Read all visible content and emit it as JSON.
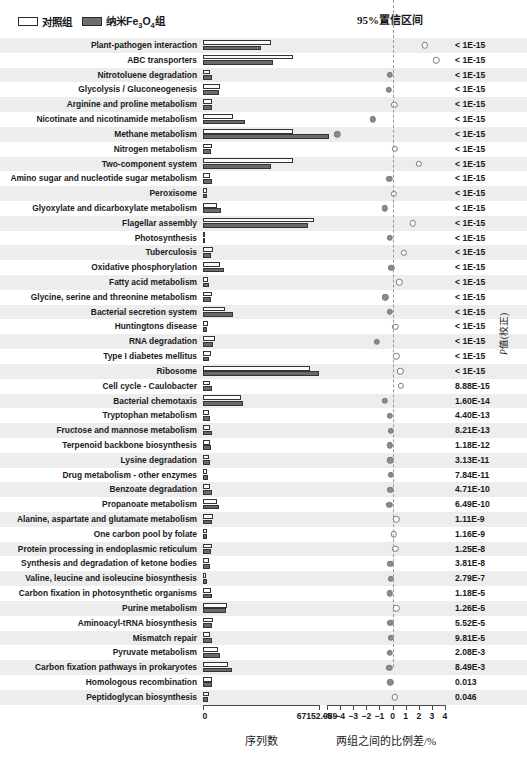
{
  "legend": {
    "control_label": "对照组",
    "treatment_label_pre": "纳米Fe",
    "treatment_label_sub": "3",
    "treatment_label_mid": "O",
    "treatment_label_sub2": "4",
    "treatment_label_post": "组",
    "treatment_label_full": "纳米Fe3O4组",
    "control_swatch_color": "#ffffff",
    "treatment_swatch_color": "#6e6e6e"
  },
  "header": {
    "ci_title": "95%置信区间"
  },
  "axes": {
    "left_title": "序列数",
    "right_title": "两组之间的比例差/%",
    "pvalue_title_prefix": "P",
    "pvalue_title_rest": "值(校正)",
    "left_ticks": [
      "0",
      "67152.089"
    ],
    "left_min": 0,
    "left_max": 67152.089,
    "right_ticks": [
      "-5",
      "-4",
      "-3",
      "-2",
      "-1",
      "0",
      "1",
      "2",
      "3",
      "4"
    ],
    "right_min": -5,
    "right_max": 4
  },
  "chart_data": {
    "type": "bar",
    "title": "",
    "subtitle": "",
    "xlabel": "序列数 / 两组之间的比例差/%",
    "ylabel": "KEGG pathway",
    "grid": false,
    "legend_position": "top-left",
    "columns": [
      "Pathway",
      "对照组 (sequence count)",
      "纳米Fe3O4组 (sequence count)",
      "Proportion difference (%)",
      "P值(校正)"
    ],
    "left_axis": {
      "label": "序列数",
      "range": [
        0,
        67152.089
      ],
      "ticks": [
        0,
        67152.089
      ]
    },
    "right_axis": {
      "label": "两组之间的比例差/%",
      "range": [
        -5,
        4
      ],
      "ticks": [
        -5,
        -4,
        -3,
        -2,
        -1,
        0,
        1,
        2,
        3,
        4
      ],
      "zero_reference_line": true
    },
    "series": [
      {
        "name": "对照组",
        "color": "#fafafa",
        "style": "open-bar"
      },
      {
        "name": "纳米Fe3O4组",
        "color": "#6a6a6a",
        "style": "filled-bar"
      }
    ],
    "rows": [
      {
        "label": "Plant-pathogen interaction",
        "control": 39300,
        "treatment": 33600,
        "diff": 2.45,
        "pvalue": "< 1E-15"
      },
      {
        "label": "ABC transporters",
        "control": 52000,
        "treatment": 40500,
        "diff": 3.35,
        "pvalue": "< 1E-15"
      },
      {
        "label": "Nitrotoluene degradation",
        "control": 4300,
        "treatment": 5300,
        "diff": -0.22,
        "pvalue": "< 1E-15"
      },
      {
        "label": "Glycolysis / Gluconeogenesis",
        "control": 10100,
        "treatment": 9300,
        "diff": -0.27,
        "pvalue": "< 1E-15"
      },
      {
        "label": "Arginine and proline metabolism",
        "control": 5100,
        "treatment": 5200,
        "diff": 0.12,
        "pvalue": "< 1E-15"
      },
      {
        "label": "Nicotinate and nicotinamide metabolism",
        "control": 17500,
        "treatment": 24300,
        "diff": -1.52,
        "pvalue": "< 1E-15"
      },
      {
        "label": "Methane metabolism",
        "control": 51900,
        "treatment": 72800,
        "diff": -4.2,
        "pvalue": "< 1E-15"
      },
      {
        "label": "Nitrogen metabolism",
        "control": 5300,
        "treatment": 4500,
        "diff": 0.18,
        "pvalue": "< 1E-15"
      },
      {
        "label": "Two-component system",
        "control": 52100,
        "treatment": 39100,
        "diff": 2.0,
        "pvalue": "< 1E-15"
      },
      {
        "label": "Amino sugar and nucleotide sugar metabolism",
        "control": 4100,
        "treatment": 5100,
        "diff": -0.24,
        "pvalue": "< 1E-15"
      },
      {
        "label": "Peroxisome",
        "control": 2600,
        "treatment": 2100,
        "diff": 0.1,
        "pvalue": "< 1E-15"
      },
      {
        "label": "Glyoxylate and dicarboxylate metabolism",
        "control": 8100,
        "treatment": 10600,
        "diff": -0.6,
        "pvalue": "< 1E-15"
      },
      {
        "label": "Flagellar assembly",
        "control": 64000,
        "treatment": 60500,
        "diff": 1.55,
        "pvalue": "< 1E-15"
      },
      {
        "label": "Photosynthesis",
        "control": 1300,
        "treatment": 1000,
        "diff": -0.2,
        "pvalue": "< 1E-15"
      },
      {
        "label": "Tuberculosis",
        "control": 5600,
        "treatment": 4500,
        "diff": 0.85,
        "pvalue": "< 1E-15"
      },
      {
        "label": "Oxidative phosphorylation",
        "control": 9900,
        "treatment": 12200,
        "diff": -0.1,
        "pvalue": "< 1E-15"
      },
      {
        "label": "Fatty acid metabolism",
        "control": 2900,
        "treatment": 3700,
        "diff": 0.5,
        "pvalue": "< 1E-15"
      },
      {
        "label": "Glycine, serine and threonine metabolism",
        "control": 5300,
        "treatment": 4600,
        "diff": -0.55,
        "pvalue": "< 1E-15"
      },
      {
        "label": "Bacterial secretion system",
        "control": 12800,
        "treatment": 17500,
        "diff": -0.22,
        "pvalue": "< 1E-15"
      },
      {
        "label": "Huntingtons disease",
        "control": 2700,
        "treatment": 2100,
        "diff": 0.22,
        "pvalue": "< 1E-15"
      },
      {
        "label": "RNA degradation",
        "control": 7100,
        "treatment": 6000,
        "diff": -1.2,
        "pvalue": "< 1E-15"
      },
      {
        "label": "Type I diabetes mellitus",
        "control": 4800,
        "treatment": 3700,
        "diff": 0.28,
        "pvalue": "< 1E-15"
      },
      {
        "label": "Ribosome",
        "control": 62100,
        "treatment": 67100,
        "diff": 0.6,
        "pvalue": "< 1E-15"
      },
      {
        "label": "Cell cycle - Caulobacter",
        "control": 4200,
        "treatment": 5100,
        "diff": 0.65,
        "pvalue": "8.88E-15"
      },
      {
        "label": "Bacterial chemotaxis",
        "control": 21800,
        "treatment": 22900,
        "diff": -0.6,
        "pvalue": "1.60E-14"
      },
      {
        "label": "Tryptophan metabolism",
        "control": 3500,
        "treatment": 4300,
        "diff": -0.2,
        "pvalue": "4.40E-13"
      },
      {
        "label": "Fructose and mannose metabolism",
        "control": 4300,
        "treatment": 5000,
        "diff": -0.15,
        "pvalue": "8.21E-13"
      },
      {
        "label": "Terpenoid backbone biosynthesis",
        "control": 4100,
        "treatment": 4700,
        "diff": -0.22,
        "pvalue": "1.18E-12"
      },
      {
        "label": "Lysine degradation",
        "control": 3300,
        "treatment": 4200,
        "diff": -0.18,
        "pvalue": "3.13E-11"
      },
      {
        "label": "Drug metabolism - other enzymes",
        "control": 2200,
        "treatment": 2900,
        "diff": -0.12,
        "pvalue": "7.84E-11"
      },
      {
        "label": "Benzoate degradation",
        "control": 4200,
        "treatment": 5100,
        "diff": -0.18,
        "pvalue": "4.71E-10"
      },
      {
        "label": "Propanoate metabolism",
        "control": 8100,
        "treatment": 9500,
        "diff": -0.25,
        "pvalue": "6.49E-10"
      },
      {
        "label": "Alanine, aspartate and glutamate metabolism",
        "control": 5700,
        "treatment": 5200,
        "diff": 0.28,
        "pvalue": "1.11E-9"
      },
      {
        "label": "One carbon pool by folate",
        "control": 2600,
        "treatment": 2200,
        "diff": 0.1,
        "pvalue": "1.16E-9"
      },
      {
        "label": "Protein processing in endoplasmic reticulum",
        "control": 5300,
        "treatment": 4700,
        "diff": 0.22,
        "pvalue": "1.25E-8"
      },
      {
        "label": "Synthesis and degradation of ketone bodies",
        "control": 3400,
        "treatment": 4200,
        "diff": -0.18,
        "pvalue": "3.81E-8"
      },
      {
        "label": "Valine, leucine and isoleucine biosynthesis",
        "control": 1800,
        "treatment": 2300,
        "diff": -0.15,
        "pvalue": "2.79E-7"
      },
      {
        "label": "Carbon fixation in photosynthetic organisms",
        "control": 4700,
        "treatment": 5200,
        "diff": -0.2,
        "pvalue": "1.18E-5"
      },
      {
        "label": "Purine metabolism",
        "control": 13800,
        "treatment": 13300,
        "diff": 0.3,
        "pvalue": "1.26E-5"
      },
      {
        "label": "Aminoacyl-tRNA biosynthesis",
        "control": 5700,
        "treatment": 5100,
        "diff": -0.18,
        "pvalue": "5.52E-5"
      },
      {
        "label": "Mismatch repair",
        "control": 4300,
        "treatment": 5000,
        "diff": -0.15,
        "pvalue": "9.81E-5"
      },
      {
        "label": "Pyruvate metabolism",
        "control": 8600,
        "treatment": 9900,
        "diff": -0.22,
        "pvalue": "2.08E-3"
      },
      {
        "label": "Carbon fixation pathways in prokaryotes",
        "control": 14600,
        "treatment": 16800,
        "diff": -0.25,
        "pvalue": "8.49E-3"
      },
      {
        "label": "Homologous recombination",
        "control": 5300,
        "treatment": 5000,
        "diff": -0.18,
        "pvalue": "0.013"
      },
      {
        "label": "Peptidoglycan biosynthesis",
        "control": 3200,
        "treatment": 2700,
        "diff": 0.15,
        "pvalue": "0.046"
      }
    ]
  }
}
